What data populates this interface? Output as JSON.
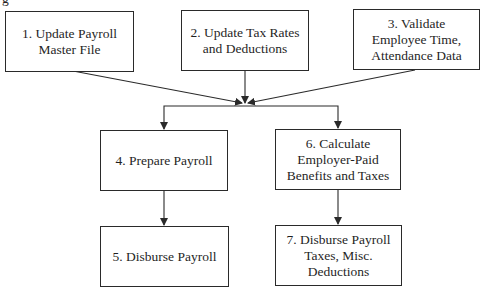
{
  "caption_fragment": "g",
  "diagram": {
    "type": "flowchart",
    "line_color": "#2a2a2a",
    "nodes": [
      {
        "id": 1,
        "label": "1. Update Payroll\nMaster File"
      },
      {
        "id": 2,
        "label": "2. Update Tax Rates\nand Deductions"
      },
      {
        "id": 3,
        "label": "3. Validate\nEmployee Time,\nAttendance Data"
      },
      {
        "id": 4,
        "label": "4. Prepare Payroll"
      },
      {
        "id": 5,
        "label": "5. Disburse Payroll"
      },
      {
        "id": 6,
        "label": "6. Calculate\nEmployer-Paid\nBenefits and Taxes"
      },
      {
        "id": 7,
        "label": "7. Disburse Payroll\nTaxes, Misc.\nDeductions"
      }
    ],
    "edges": [
      {
        "from": 1,
        "to": "merge"
      },
      {
        "from": 2,
        "to": "merge"
      },
      {
        "from": 3,
        "to": "merge"
      },
      {
        "from": "merge",
        "to": 4
      },
      {
        "from": "merge",
        "to": 6
      },
      {
        "from": 4,
        "to": 5
      },
      {
        "from": 6,
        "to": 7
      }
    ]
  }
}
